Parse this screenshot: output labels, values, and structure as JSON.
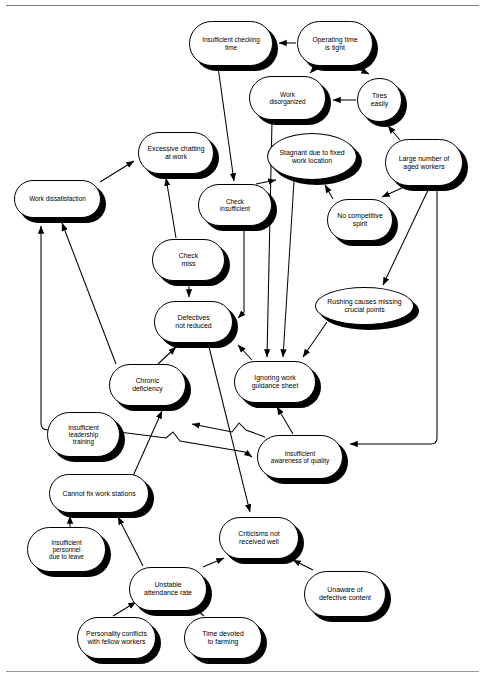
{
  "diagram": {
    "type": "relations-diagram",
    "node_shape_default": "rounded-rectangle",
    "edge_style": "directed-arrow",
    "colors": {
      "node_fill": "#ffffff",
      "node_stroke": "#000000",
      "shadow": "#000000",
      "rule": "#7d7d7d"
    },
    "nodes": [
      {
        "id": "n1",
        "label": "Insufficient checking\ntime",
        "shape": "rounded-rectangle",
        "x": 189,
        "y": 21,
        "w": 84,
        "h": 45
      },
      {
        "id": "n2",
        "label": "Operating time\nis tight",
        "shape": "rounded-rectangle",
        "x": 297,
        "y": 21,
        "w": 76,
        "h": 45
      },
      {
        "id": "n3",
        "label": "Work\ndisorganized",
        "shape": "rounded-rectangle",
        "x": 249,
        "y": 76,
        "w": 77,
        "h": 44
      },
      {
        "id": "n4",
        "label": "Tires\neasily",
        "shape": "rounded-rectangle",
        "x": 357,
        "y": 78,
        "w": 45,
        "h": 44
      },
      {
        "id": "n5",
        "label": "Stagnant due to fixed\nwork location",
        "shape": "ellipse",
        "x": 267,
        "y": 133,
        "w": 90,
        "h": 47
      },
      {
        "id": "n6",
        "label": "Large number of\naged workers",
        "shape": "rounded-rectangle",
        "x": 385,
        "y": 139,
        "w": 78,
        "h": 47
      },
      {
        "id": "n7",
        "label": "Excessive chatting\nat work",
        "shape": "rounded-rectangle",
        "x": 138,
        "y": 132,
        "w": 76,
        "h": 42
      },
      {
        "id": "n8",
        "label": "Check\ninsufficient",
        "shape": "rounded-rectangle",
        "x": 198,
        "y": 184,
        "w": 74,
        "h": 42
      },
      {
        "id": "n9",
        "label": "Work dissatisfaction",
        "shape": "rounded-rectangle",
        "x": 14,
        "y": 180,
        "w": 87,
        "h": 38
      },
      {
        "id": "n10",
        "label": "No competitive\nspirit",
        "shape": "rounded-rectangle",
        "x": 327,
        "y": 199,
        "w": 66,
        "h": 42
      },
      {
        "id": "n11",
        "label": "Check\nmiss",
        "shape": "rounded-rectangle",
        "x": 152,
        "y": 239,
        "w": 73,
        "h": 42
      },
      {
        "id": "n12",
        "label": "Rushing causes missing\ncrucial points",
        "shape": "ellipse",
        "x": 315,
        "y": 287,
        "w": 99,
        "h": 38
      },
      {
        "id": "n13",
        "label": "Defectives\nnot reduced",
        "shape": "rounded-rectangle",
        "x": 154,
        "y": 301,
        "w": 79,
        "h": 42
      },
      {
        "id": "n14",
        "label": "Ignoring work\nguidance sheet",
        "shape": "rounded-rectangle",
        "x": 234,
        "y": 361,
        "w": 82,
        "h": 42
      },
      {
        "id": "n15",
        "label": "Chronic\ndeficiency",
        "shape": "rounded-rectangle",
        "x": 109,
        "y": 364,
        "w": 77,
        "h": 42
      },
      {
        "id": "n16",
        "label": "Insufficient\nleadership\ntraining",
        "shape": "rounded-rectangle",
        "x": 47,
        "y": 412,
        "w": 73,
        "h": 45
      },
      {
        "id": "n17",
        "label": "Insufficient\nawareness of quality",
        "shape": "rounded-rectangle",
        "x": 257,
        "y": 435,
        "w": 86,
        "h": 44
      },
      {
        "id": "n18",
        "label": "Cannot fix work stations",
        "shape": "rounded-rectangle",
        "x": 49,
        "y": 474,
        "w": 100,
        "h": 39
      },
      {
        "id": "n19",
        "label": "Criticisms not\nreceived well",
        "shape": "rounded-rectangle",
        "x": 219,
        "y": 517,
        "w": 80,
        "h": 42
      },
      {
        "id": "n20",
        "label": "Insufficient\npersonnel\ndue to leave",
        "shape": "rounded-rectangle",
        "x": 27,
        "y": 527,
        "w": 79,
        "h": 45
      },
      {
        "id": "n21",
        "label": "Unstable\nattendance rate",
        "shape": "rounded-rectangle",
        "x": 129,
        "y": 567,
        "w": 78,
        "h": 44
      },
      {
        "id": "n22",
        "label": "Unaware of\ndefective content",
        "shape": "rounded-rectangle",
        "x": 304,
        "y": 571,
        "w": 82,
        "h": 46
      },
      {
        "id": "n23",
        "label": "Personality conflicts\nwith fellow workers",
        "shape": "rounded-rectangle",
        "x": 77,
        "y": 617,
        "w": 79,
        "h": 42
      },
      {
        "id": "n24",
        "label": "Time devoted\nto farming",
        "shape": "rounded-rectangle",
        "x": 184,
        "y": 617,
        "w": 78,
        "h": 42
      }
    ],
    "edges": [
      {
        "from": "n2",
        "to": "n1",
        "label": ""
      },
      {
        "from": "n2",
        "to": "n3",
        "label": ""
      },
      {
        "from": "n2",
        "to": "n4",
        "label": ""
      },
      {
        "from": "n4",
        "to": "n3",
        "label": ""
      },
      {
        "from": "n6",
        "to": "n4",
        "label": ""
      },
      {
        "from": "n6",
        "to": "n10",
        "label": ""
      },
      {
        "from": "n6",
        "to": "n12",
        "label": ""
      },
      {
        "from": "n6",
        "to": "n17",
        "label": ""
      },
      {
        "from": "n1",
        "to": "n8",
        "label": ""
      },
      {
        "from": "n3",
        "to": "n14",
        "label": ""
      },
      {
        "from": "n5",
        "to": "n14",
        "label": ""
      },
      {
        "from": "n12",
        "to": "n14",
        "label": ""
      },
      {
        "from": "n10",
        "to": "n5",
        "label": ""
      },
      {
        "from": "n14",
        "to": "n13",
        "label": ""
      },
      {
        "from": "n8",
        "to": "n13",
        "label": ""
      },
      {
        "from": "n11",
        "to": "n13",
        "label": ""
      },
      {
        "from": "n11",
        "to": "n7",
        "label": ""
      },
      {
        "from": "n8",
        "to": "n5",
        "label": ""
      },
      {
        "from": "n9",
        "to": "n7",
        "label": ""
      },
      {
        "from": "n15",
        "to": "n13",
        "label": ""
      },
      {
        "from": "n15",
        "to": "n9",
        "label": ""
      },
      {
        "from": "n16",
        "to": "n9",
        "label": ""
      },
      {
        "from": "n16",
        "to": "n17",
        "label": ""
      },
      {
        "from": "n17",
        "to": "n15",
        "label": ""
      },
      {
        "from": "n17",
        "to": "n14",
        "label": ""
      },
      {
        "from": "n18",
        "to": "n15",
        "label": ""
      },
      {
        "from": "n13",
        "to": "n19",
        "label": ""
      },
      {
        "from": "n20",
        "to": "n18",
        "label": ""
      },
      {
        "from": "n21",
        "to": "n18",
        "label": ""
      },
      {
        "from": "n21",
        "to": "n19",
        "label": ""
      },
      {
        "from": "n22",
        "to": "n19",
        "label": ""
      },
      {
        "from": "n23",
        "to": "n21",
        "label": ""
      },
      {
        "from": "n24",
        "to": "n21",
        "label": ""
      }
    ]
  }
}
